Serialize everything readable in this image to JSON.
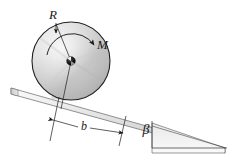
{
  "figure": {
    "type": "engineering-mechanics-free-body-diagram",
    "labels": {
      "radius": "R",
      "moment": "M",
      "distance": "b",
      "angle": "β"
    },
    "colors": {
      "outline": "#1a1a1a",
      "wheel_light": "#fdfdfd",
      "wheel_mid": "#d8d8d8",
      "wheel_dark": "#9a9a9a",
      "incline_light": "#f4f4f4",
      "incline_mid": "#dedede",
      "incline_dark": "#b4b4b4",
      "hub": "#151515",
      "background": "#ffffff"
    },
    "geometry": {
      "wheel_center_x": 71,
      "wheel_center_y": 61,
      "wheel_radius": 39,
      "incline_angle_deg": 17,
      "contact_x": 60,
      "contact_y": 98
    }
  }
}
